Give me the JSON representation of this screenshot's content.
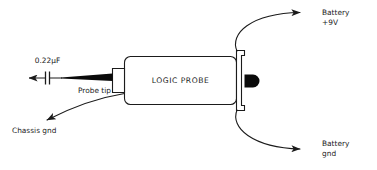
{
  "diagram": {
    "background_color": "#ffffff",
    "line_color": "#1b1b1b",
    "fill_color": "#0a0a0a",
    "device": {
      "label": "LOGIC PROBE"
    },
    "labels": {
      "capacitor": "0.22µF",
      "probe_tip": "Probe tip",
      "chassis_gnd": "Chassis gnd",
      "battery_pos_line1": "Battery",
      "battery_pos_line2": "+9V",
      "battery_gnd_line1": "Battery",
      "battery_gnd_line2": "gnd"
    },
    "components": {
      "capacitor_name": "non-polarized-capacitor",
      "probe_needle_name": "probe-needle",
      "flange_name": "connector-flange",
      "end_cap_name": "black-end-cap"
    },
    "connections": [
      {
        "name": "capacitor-lead",
        "from": "probe tip",
        "to": "0.22µF capacitor",
        "arrow": "left"
      },
      {
        "name": "chassis-ground-wire",
        "from": "probe body",
        "to": "Chassis gnd",
        "arrow": "down-left"
      },
      {
        "name": "battery-positive-wire",
        "from": "connector flange",
        "to": "Battery +9V",
        "arrow": "right"
      },
      {
        "name": "battery-ground-wire",
        "from": "connector flange",
        "to": "Battery gnd",
        "arrow": "right"
      }
    ]
  }
}
